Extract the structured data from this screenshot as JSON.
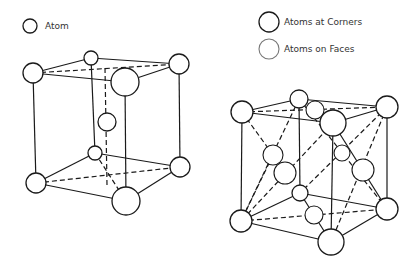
{
  "legend_left": {
    "items": [
      {
        "label": "Atom",
        "kind": "atom"
      }
    ]
  },
  "legend_right": {
    "items": [
      {
        "label": "Atoms at Corners",
        "kind": "corner"
      },
      {
        "label": "Atoms on Faces",
        "kind": "face"
      }
    ]
  },
  "diagrams": [
    {
      "name": "body-centered-cubic",
      "atoms": [
        "corner-top-left",
        "corner-top-back",
        "corner-top-right",
        "corner-top-front",
        "center",
        "corner-bottom-back",
        "corner-bottom-left",
        "corner-bottom-right",
        "corner-bottom-front"
      ]
    },
    {
      "name": "face-centered-cubic",
      "atoms": [
        "corner-top-left",
        "corner-top-back",
        "corner-top-right",
        "corner-top-front",
        "face-top",
        "face-left",
        "face-front",
        "face-back",
        "face-right",
        "face-bottom",
        "corner-bottom-back",
        "corner-bottom-left",
        "corner-bottom-right",
        "corner-bottom-front"
      ]
    }
  ],
  "colors": {
    "line": "#1a1a1a",
    "background": "#ffffff",
    "face_legend_stroke": "#777777"
  }
}
